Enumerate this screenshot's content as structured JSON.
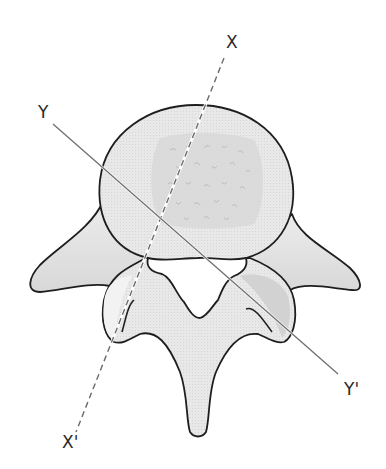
{
  "figure": {
    "colors": {
      "outline": "#1e1e1e",
      "bone_fill": "#e6e6e6",
      "cancellous_fill": "#d4d4d4",
      "shadow_fill": "#cfcfcf",
      "axis_line": "#6f6f6f",
      "background": "#ffffff"
    }
  },
  "axes": [
    {
      "id": "X",
      "style": "dashed",
      "start_label": "X",
      "end_label": "X'",
      "from": [
        224,
        58
      ],
      "to": [
        76,
        432
      ]
    },
    {
      "id": "Y",
      "style": "solid",
      "start_label": "Y",
      "end_label": "Y'",
      "from": [
        53,
        124
      ],
      "to": [
        338,
        374
      ]
    }
  ],
  "labels": {
    "x_top": "X",
    "x_bottom": "X'",
    "y_top": "Y",
    "y_bottom": "Y'"
  }
}
